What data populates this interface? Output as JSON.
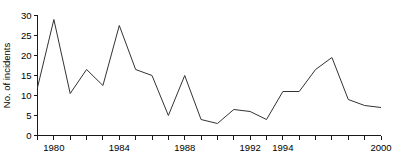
{
  "chart_data": {
    "type": "line",
    "title": "",
    "xlabel": "",
    "ylabel": "No. of incidents",
    "xlim": [
      1979,
      2000
    ],
    "ylim": [
      0,
      30
    ],
    "grid": false,
    "legend": "none",
    "y_ticks": [
      0,
      5,
      10,
      15,
      20,
      25,
      30
    ],
    "y_tick_labels": [
      "0",
      "5",
      "10",
      "15",
      "20",
      "25",
      "30"
    ],
    "x_ticks": [
      1979,
      1980,
      1981,
      1982,
      1983,
      1984,
      1985,
      1986,
      1987,
      1988,
      1989,
      1990,
      1991,
      1992,
      1993,
      1994,
      1995,
      1996,
      1997,
      1998,
      1999,
      2000
    ],
    "x_tick_labels": [
      {
        "value": 1980,
        "label": "1980"
      },
      {
        "value": 1984,
        "label": "1984"
      },
      {
        "value": 1988,
        "label": "1988"
      },
      {
        "value": 1992,
        "label": "1992"
      },
      {
        "value": 1994,
        "label": "1994"
      },
      {
        "value": 2000,
        "label": "2000"
      }
    ],
    "x": [
      1979,
      1980,
      1981,
      1982,
      1983,
      1984,
      1985,
      1986,
      1987,
      1988,
      1989,
      1990,
      1991,
      1992,
      1993,
      1994,
      1995,
      1996,
      1997,
      1998,
      1999,
      2000
    ],
    "values": [
      12,
      29,
      10.5,
      16.5,
      12.5,
      27.5,
      16.5,
      15,
      5,
      15,
      4,
      3,
      6.5,
      6,
      4,
      11,
      11,
      16.5,
      19.5,
      9,
      7.5,
      7
    ],
    "series": [
      {
        "name": "No. of incidents",
        "color": "#333333",
        "values": [
          12,
          29,
          10.5,
          16.5,
          12.5,
          27.5,
          16.5,
          15,
          5,
          15,
          4,
          3,
          6.5,
          6,
          4,
          11,
          11,
          16.5,
          19.5,
          9,
          7.5,
          7
        ]
      }
    ]
  }
}
